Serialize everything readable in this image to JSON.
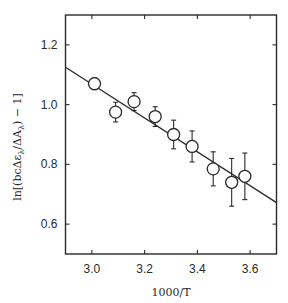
{
  "chart_data": {
    "type": "scatter",
    "title": "",
    "xlabel": "1000/T",
    "ylabel": "ln[(bcΔε_λ/ΔA_λ) − 1]",
    "ylabel_parts": {
      "prefix": "ln[(bcΔε",
      "sub1": "λ",
      "mid": "/ΔA",
      "sub2": "λ",
      "suffix": ") − 1]"
    },
    "xlim": [
      2.9,
      3.7
    ],
    "ylim": [
      0.5,
      1.3
    ],
    "xticks": [
      3.0,
      3.2,
      3.4,
      3.6
    ],
    "xtick_labels": [
      "3.0",
      "3.2",
      "3.4",
      "3.6"
    ],
    "yticks": [
      0.6,
      0.8,
      1.0,
      1.2
    ],
    "ytick_labels": [
      "0.6",
      "0.8",
      "1.0",
      "1.2"
    ],
    "grid": false,
    "legend": null,
    "series": [
      {
        "name": "data",
        "marker": "open-circle",
        "x": [
          3.01,
          3.09,
          3.16,
          3.24,
          3.31,
          3.38,
          3.46,
          3.53,
          3.58
        ],
        "y": [
          1.07,
          0.975,
          1.01,
          0.96,
          0.9,
          0.86,
          0.785,
          0.74,
          0.76
        ],
        "yerr": [
          0.02,
          0.033,
          0.03,
          0.033,
          0.048,
          0.052,
          0.057,
          0.08,
          0.078
        ]
      },
      {
        "name": "linear fit",
        "type": "line",
        "x": [
          2.9,
          3.7
        ],
        "y": [
          1.125,
          0.672
        ]
      }
    ]
  },
  "colors": {
    "ink": "#2a2a2a",
    "background": "#ffffff"
  }
}
